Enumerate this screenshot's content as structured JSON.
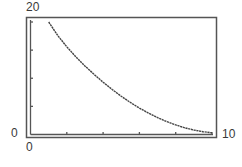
{
  "chart_data": {
    "type": "line",
    "title": "",
    "xlabel": "",
    "ylabel": "",
    "xlim": [
      0,
      10
    ],
    "ylim": [
      0,
      20
    ],
    "x_tick_labels": [
      "0",
      "10"
    ],
    "y_tick_labels": [
      "0",
      "20"
    ],
    "x_ticks": [
      0,
      2,
      4,
      6,
      8,
      10
    ],
    "y_ticks": [
      0,
      5,
      10,
      15,
      20
    ],
    "grid": false,
    "legend": null,
    "series": [
      {
        "name": "decay curve",
        "x": [
          1.0,
          1.5,
          2.0,
          2.5,
          3.0,
          3.5,
          4.0,
          4.5,
          5.0,
          5.5,
          6.0,
          6.5,
          7.0,
          7.5,
          8.0,
          8.5,
          9.0,
          9.5,
          10.0
        ],
        "y": [
          20.0,
          17.6,
          15.6,
          13.8,
          12.2,
          10.7,
          9.3,
          8.0,
          6.8,
          5.7,
          4.7,
          3.8,
          3.0,
          2.3,
          1.7,
          1.2,
          0.8,
          0.5,
          0.3
        ]
      }
    ]
  },
  "labels": {
    "y_max": "20",
    "y_min": "0",
    "x_min": "0",
    "x_max": "10"
  },
  "colors": {
    "frame": "#555555",
    "curve": "#444444",
    "text": "#3a3a3a"
  }
}
